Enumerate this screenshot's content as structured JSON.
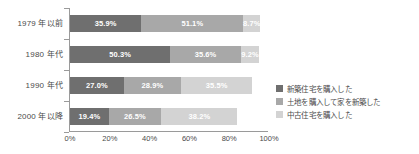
{
  "chart_data": {
    "type": "bar",
    "orientation": "horizontal",
    "stacked": true,
    "title": "",
    "xlabel": "",
    "ylabel": "",
    "xlim": [
      0,
      100
    ],
    "grid": false,
    "legend_position": "right",
    "categories": [
      "1979 年以前",
      "1980 年代",
      "1990 年代",
      "2000 年以降"
    ],
    "xtick_labels": [
      "0%",
      "20%",
      "40%",
      "60%",
      "80%",
      "100%"
    ],
    "xtick_values": [
      0,
      20,
      40,
      60,
      80,
      100
    ],
    "series": [
      {
        "name": "新築住宅を購入した",
        "color": "#6f6f6f",
        "values": [
          35.9,
          50.3,
          27.0,
          19.4
        ],
        "labels": [
          "35.9%",
          "50.3%",
          "27.0%",
          "19.4%"
        ]
      },
      {
        "name": "土地を購入して家を新築した",
        "color": "#a8a8a8",
        "values": [
          51.1,
          35.6,
          28.9,
          26.5
        ],
        "labels": [
          "51.1%",
          "35.6%",
          "28.9%",
          "26.5%"
        ]
      },
      {
        "name": "中古住宅を購入した",
        "color": "#d3d3d3",
        "values": [
          8.7,
          9.2,
          35.5,
          38.2
        ],
        "labels": [
          "8.7%",
          "9.2%",
          "35.5%",
          "38.2%"
        ]
      }
    ]
  },
  "legend": {
    "items": [
      {
        "label": "新築住宅を購入した",
        "swatch": "#6f6f6f"
      },
      {
        "label": "土地を購入して家を新築した",
        "swatch": "#a8a8a8"
      },
      {
        "label": "中古住宅を購入した",
        "swatch": "#d3d3d3"
      }
    ]
  }
}
